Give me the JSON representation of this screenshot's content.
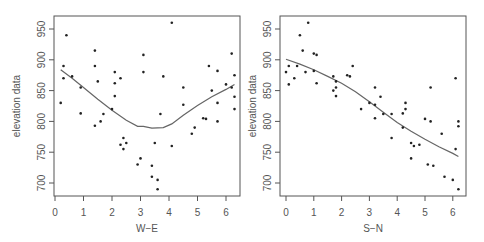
{
  "chart_data": [
    {
      "type": "scatter",
      "title": "",
      "xlabel": "W−E",
      "ylabel": "elevation data",
      "xlim": [
        0,
        6.4
      ],
      "ylim": [
        680,
        965
      ],
      "xticks": [
        0,
        1,
        2,
        3,
        4,
        5,
        6
      ],
      "yticks": [
        700,
        750,
        800,
        850,
        900,
        950
      ],
      "grid": false,
      "points": [
        [
          0.2,
          830
        ],
        [
          0.3,
          890
        ],
        [
          0.3,
          870
        ],
        [
          0.4,
          940
        ],
        [
          0.6,
          873
        ],
        [
          0.9,
          855
        ],
        [
          0.9,
          813
        ],
        [
          1.4,
          915
        ],
        [
          1.4,
          890
        ],
        [
          1.4,
          793
        ],
        [
          1.5,
          865
        ],
        [
          1.6,
          800
        ],
        [
          1.7,
          812
        ],
        [
          2.0,
          820
        ],
        [
          2.1,
          880
        ],
        [
          2.1,
          862
        ],
        [
          2.1,
          841
        ],
        [
          2.3,
          870
        ],
        [
          2.3,
          762
        ],
        [
          2.4,
          773
        ],
        [
          2.4,
          755
        ],
        [
          2.5,
          765
        ],
        [
          2.9,
          730
        ],
        [
          3.0,
          740
        ],
        [
          3.1,
          908
        ],
        [
          3.1,
          880
        ],
        [
          3.4,
          728
        ],
        [
          3.4,
          710
        ],
        [
          3.5,
          765
        ],
        [
          3.6,
          705
        ],
        [
          3.6,
          690
        ],
        [
          3.7,
          812
        ],
        [
          3.8,
          873
        ],
        [
          4.1,
          960
        ],
        [
          4.1,
          760
        ],
        [
          4.5,
          855
        ],
        [
          4.5,
          827
        ],
        [
          4.8,
          780
        ],
        [
          4.9,
          790
        ],
        [
          5.2,
          805
        ],
        [
          5.3,
          804
        ],
        [
          5.4,
          890
        ],
        [
          5.5,
          850
        ],
        [
          5.7,
          882
        ],
        [
          5.7,
          830
        ],
        [
          5.7,
          800
        ],
        [
          6.0,
          860
        ],
        [
          6.2,
          910
        ],
        [
          6.2,
          855
        ],
        [
          6.3,
          875
        ],
        [
          6.3,
          840
        ],
        [
          6.3,
          820
        ]
      ],
      "smooth_line": [
        [
          0.2,
          884
        ],
        [
          0.6,
          870
        ],
        [
          1.0,
          855
        ],
        [
          1.5,
          836
        ],
        [
          2.0,
          818
        ],
        [
          2.5,
          802
        ],
        [
          2.9,
          792
        ],
        [
          3.1,
          792
        ],
        [
          3.4,
          789
        ],
        [
          3.8,
          790
        ],
        [
          4.1,
          796
        ],
        [
          4.5,
          810
        ],
        [
          5.0,
          826
        ],
        [
          5.5,
          840
        ],
        [
          6.0,
          852
        ],
        [
          6.3,
          860
        ]
      ]
    },
    {
      "type": "scatter",
      "title": "",
      "xlabel": "S−N",
      "ylabel": "elevation data",
      "xlim": [
        -0.2,
        6.5
      ],
      "ylim": [
        680,
        965
      ],
      "xticks": [
        0,
        1,
        2,
        3,
        4,
        5,
        6
      ],
      "yticks": [
        700,
        750,
        800,
        850,
        900,
        950
      ],
      "grid": false,
      "points": [
        [
          0.0,
          880
        ],
        [
          0.1,
          890
        ],
        [
          0.1,
          860
        ],
        [
          0.3,
          870
        ],
        [
          0.4,
          890
        ],
        [
          0.5,
          940
        ],
        [
          0.6,
          915
        ],
        [
          0.7,
          880
        ],
        [
          0.8,
          960
        ],
        [
          1.0,
          910
        ],
        [
          1.0,
          882
        ],
        [
          1.1,
          908
        ],
        [
          1.1,
          862
        ],
        [
          1.7,
          873
        ],
        [
          1.7,
          850
        ],
        [
          1.8,
          865
        ],
        [
          1.8,
          855
        ],
        [
          1.8,
          841
        ],
        [
          2.2,
          875
        ],
        [
          2.3,
          873
        ],
        [
          2.4,
          890
        ],
        [
          2.7,
          820
        ],
        [
          3.0,
          830
        ],
        [
          3.2,
          855
        ],
        [
          3.2,
          827
        ],
        [
          3.2,
          805
        ],
        [
          3.4,
          840
        ],
        [
          3.5,
          812
        ],
        [
          3.8,
          812
        ],
        [
          3.8,
          773
        ],
        [
          4.2,
          813
        ],
        [
          4.2,
          790
        ],
        [
          4.3,
          830
        ],
        [
          4.3,
          820
        ],
        [
          4.5,
          765
        ],
        [
          4.5,
          740
        ],
        [
          4.6,
          760
        ],
        [
          4.8,
          762
        ],
        [
          5.0,
          804
        ],
        [
          5.1,
          730
        ],
        [
          5.2,
          855
        ],
        [
          5.2,
          800
        ],
        [
          5.3,
          728
        ],
        [
          5.6,
          780
        ],
        [
          5.7,
          710
        ],
        [
          6.0,
          705
        ],
        [
          6.1,
          870
        ],
        [
          6.1,
          755
        ],
        [
          6.2,
          800
        ],
        [
          6.2,
          792
        ],
        [
          6.2,
          690
        ]
      ],
      "smooth_line": [
        [
          0.0,
          901
        ],
        [
          0.5,
          893
        ],
        [
          1.0,
          884
        ],
        [
          1.5,
          873
        ],
        [
          2.0,
          862
        ],
        [
          2.5,
          848
        ],
        [
          3.0,
          832
        ],
        [
          3.5,
          815
        ],
        [
          4.0,
          798
        ],
        [
          4.5,
          784
        ],
        [
          5.0,
          771
        ],
        [
          5.5,
          759
        ],
        [
          6.0,
          748
        ],
        [
          6.2,
          743
        ]
      ]
    }
  ],
  "panels": [
    {
      "xlabel": "W−E",
      "ylabel": "elevation data"
    },
    {
      "xlabel": "S−N",
      "ylabel": "elevation data"
    }
  ]
}
